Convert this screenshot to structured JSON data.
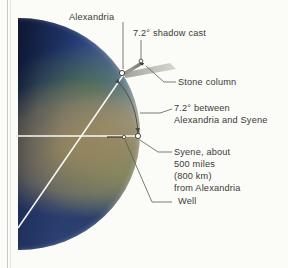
{
  "figure": {
    "background_color": "#fbfbf7",
    "text_color": "#3a3a38",
    "ray_color": "#ffffff",
    "leader_color": "#5b5b57"
  },
  "globe": {
    "name": "Earth",
    "day_side": "right",
    "night_side": "left",
    "ocean_color": "#283a68",
    "desert_color": "#96865c",
    "vegetation_color": "#4e7046",
    "terminator_color": "#060a18"
  },
  "labels": {
    "alexandria": "Alexandria",
    "shadow_cast": "7.2° shadow cast",
    "stone_column": "Stone column",
    "angle_between_line1": "7.2° between",
    "angle_between_line2": "Alexandria and Syene",
    "syene_line1": "Syene, about",
    "syene_line2": "500 miles",
    "syene_line3": "(800 km)",
    "syene_line4": "from Alexandria",
    "well": "Well"
  },
  "measurements": {
    "shadow_angle": "7.2°",
    "central_angle": "7.2°",
    "distance_miles": "500 miles",
    "distance_km": "800 km"
  },
  "markers": {
    "alexandria_point": "Alexandria city marker",
    "syene_point": "Syene city marker",
    "column_top_point": "top of stone column",
    "well_point": "well opening marker"
  }
}
